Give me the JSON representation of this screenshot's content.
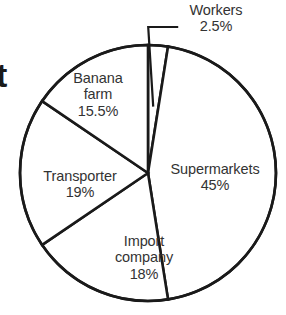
{
  "chart_data": {
    "type": "pie",
    "title": "",
    "subtitle": "",
    "xlabel": "",
    "ylabel": "",
    "legend_position": "none",
    "grid": false,
    "units": "percent",
    "start_angle_deg": 0,
    "direction": "clockwise",
    "categories": [
      "Workers",
      "Supermarkets",
      "Import company",
      "Transporter",
      "Banana farm"
    ],
    "values": [
      2.5,
      45,
      18,
      19,
      15.5
    ],
    "slices": [
      {
        "name": "Workers",
        "value": 2.5,
        "value_label": "2.5%",
        "label_lines": [
          "Workers"
        ],
        "start_deg": 0,
        "end_deg": 9,
        "label_placement": "outside-leader",
        "fill": "#ffffff",
        "stroke": "#1a1a1a"
      },
      {
        "name": "Supermarkets",
        "value": 45,
        "value_label": "45%",
        "label_lines": [
          "Supermarkets"
        ],
        "start_deg": 9,
        "end_deg": 171,
        "label_placement": "inside",
        "fill": "#ffffff",
        "stroke": "#1a1a1a"
      },
      {
        "name": "Import company",
        "value": 18,
        "value_label": "18%",
        "label_lines": [
          "Import",
          "company"
        ],
        "start_deg": 171,
        "end_deg": 235.8,
        "label_placement": "inside",
        "fill": "#ffffff",
        "stroke": "#1a1a1a"
      },
      {
        "name": "Transporter",
        "value": 19,
        "value_label": "19%",
        "label_lines": [
          "Transporter"
        ],
        "start_deg": 235.8,
        "end_deg": 304.2,
        "label_placement": "inside",
        "fill": "#ffffff",
        "stroke": "#1a1a1a"
      },
      {
        "name": "Banana farm",
        "value": 15.5,
        "value_label": "15.5%",
        "label_lines": [
          "Banana",
          "farm"
        ],
        "start_deg": 304.2,
        "end_deg": 360,
        "label_placement": "inside",
        "fill": "#ffffff",
        "stroke": "#1a1a1a"
      }
    ],
    "geometry": {
      "center_x": 148,
      "center_y": 173,
      "radius": 128
    }
  },
  "labels": {
    "supermarkets": {
      "name": "Supermarkets",
      "value": "45%"
    },
    "import_company": {
      "name_line1": "Import",
      "name_line2": "company",
      "value": "18%"
    },
    "transporter": {
      "name": "Transporter",
      "value": "19%"
    },
    "banana_farm": {
      "name_line1": "Banana",
      "name_line2": "farm",
      "value": "15.5%"
    },
    "workers": {
      "name": "Workers",
      "value": "2.5%"
    }
  },
  "edge_text": {
    "partial_glyph": "t"
  },
  "colors": {
    "slice_fill": "#ffffff",
    "slice_stroke": "#1a1a1a",
    "label_text": "#333333",
    "background": "#ffffff"
  }
}
